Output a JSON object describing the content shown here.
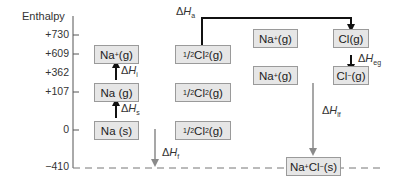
{
  "axis": {
    "label": "Enthalpy",
    "ticks": [
      {
        "label": "+730",
        "y": 35
      },
      {
        "label": "+609",
        "y": 54
      },
      {
        "label": "+362",
        "y": 73
      },
      {
        "label": "+107",
        "y": 92
      },
      {
        "label": "0",
        "y": 130
      },
      {
        "label": "−410",
        "y": 167
      }
    ]
  },
  "boxes": {
    "na_plus_g_1": {
      "main": "Na",
      "sup": "+",
      "tail": " (g)"
    },
    "na_g": {
      "main": "Na (g)"
    },
    "na_s": {
      "main": "Na (s)"
    },
    "half_cl2_1": {
      "frac": "1",
      "den": "2",
      "main": " Cl",
      "sub": "2",
      "tail": "(g)"
    },
    "half_cl2_2": {
      "frac": "1",
      "den": "2",
      "main": " Cl",
      "sub": "2",
      "tail": "(g)"
    },
    "half_cl2_3": {
      "frac": "1",
      "den": "2",
      "main": " Cl",
      "sub": "2",
      "tail": "(g)"
    },
    "na_plus_g_2": {
      "main": "Na",
      "sup": "+",
      "tail": " (g)"
    },
    "na_plus_g_3": {
      "main": "Na",
      "sup": "+",
      "tail": " (g)"
    },
    "cl_g": {
      "main": "Cl(g)"
    },
    "cl_minus_g": {
      "main": "Cl",
      "sup": "−",
      "tail": "(g)"
    },
    "nacl_s": {
      "main": "Na",
      "sup": "+",
      "mid": "Cl",
      "sup2": "−",
      "tail": "(s)"
    }
  },
  "enthalpy_changes": {
    "ionisation": {
      "delta": "Δ",
      "H": "H",
      "sub": "i"
    },
    "sublimation": {
      "delta": "Δ",
      "H": "H",
      "sub": "s"
    },
    "atomisation": {
      "delta": "Δ",
      "H": "H",
      "sub": "a"
    },
    "electron_gain": {
      "delta": "Δ",
      "H": "H",
      "sub": "eg"
    },
    "lattice_formation": {
      "delta": "Δ",
      "H": "H",
      "sub": "lf"
    },
    "formation": {
      "delta": "Δ",
      "H": "H",
      "sub": "f"
    }
  },
  "colors": {
    "box_fill": "#e6e6e6",
    "box_border": "#9a9a9a",
    "arrow_dark": "#111111",
    "arrow_grey": "#8a8a8a"
  }
}
